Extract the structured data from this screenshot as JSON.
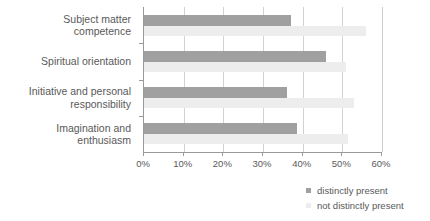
{
  "chart_data": {
    "type": "bar",
    "orientation": "horizontal",
    "title": "",
    "xlabel": "",
    "ylabel": "",
    "xlim": [
      0,
      60
    ],
    "xtick_labels": [
      "0%",
      "10%",
      "20%",
      "30%",
      "40%",
      "50%",
      "60%"
    ],
    "xtick_values": [
      0,
      10,
      20,
      30,
      40,
      50,
      60
    ],
    "grid": true,
    "legend_position": "bottom-right",
    "categories": [
      "Subject matter\ncompetence",
      "Spiritual orientation",
      "Initiative and personal\nresponsibility",
      "Imagination and\nenthusiasm"
    ],
    "series": [
      {
        "name": "distinctly present",
        "color": "#a0a0a0",
        "values": [
          37,
          46,
          36,
          38.5
        ]
      },
      {
        "name": "not distinctly present",
        "color": "#ededed",
        "values": [
          56,
          51,
          53,
          51.5
        ]
      }
    ]
  },
  "colors": {
    "series_distinctly_present": "#a0a0a0",
    "series_not_distinctly_present": "#ededed",
    "text": "#595959",
    "axis": "#9a9a9a",
    "gridline": "#d2d2d2",
    "background": "#ffffff"
  }
}
